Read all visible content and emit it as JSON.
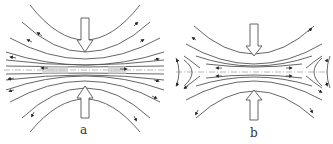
{
  "figure": {
    "panels": [
      {
        "id": "a",
        "label": "a",
        "description": "Stream lines compressed toward central axis; flow directed outward along axis with shaded regions near center"
      },
      {
        "id": "b",
        "label": "b",
        "description": "Stream lines compressed toward axis; flow diverges at both ends forming X-type reversal near edges"
      }
    ],
    "colors": {
      "line": "#555555",
      "background": "#ffffff",
      "arrow_fill": "#ffffff"
    },
    "icons": {
      "compression_arrow": "hollow-double-arrow",
      "flow_arrow": "arrowhead"
    }
  }
}
